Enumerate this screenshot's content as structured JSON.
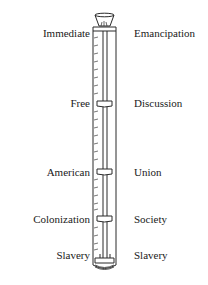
{
  "diagram": {
    "type": "thermometer-tube scale",
    "left_labels": [
      {
        "text": "Immediate",
        "y": 33
      },
      {
        "text": "Free",
        "y": 102
      },
      {
        "text": "American",
        "y": 170
      },
      {
        "text": "Colonization",
        "y": 217
      },
      {
        "text": "Slavery",
        "y": 250
      }
    ],
    "right_labels": [
      {
        "text": "Emancipation",
        "y": 33
      },
      {
        "text": "Discussion",
        "y": 102
      },
      {
        "text": "Union",
        "y": 170
      },
      {
        "text": "Society",
        "y": 217
      },
      {
        "text": "Slavery",
        "y": 250
      }
    ],
    "colors": {
      "line": "#2a2a2a",
      "background": "#ffffff"
    }
  }
}
